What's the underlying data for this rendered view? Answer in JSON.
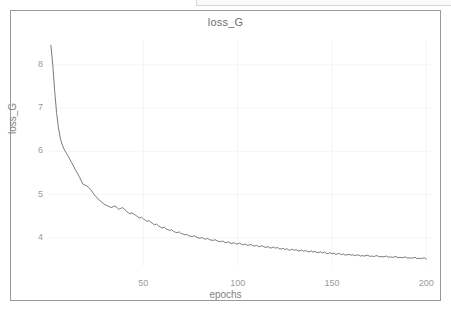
{
  "chart_data": {
    "type": "line",
    "title": "loss_G",
    "xlabel": "epochs",
    "ylabel": "loss_G",
    "xlim": [
      0,
      203
    ],
    "ylim": [
      3.35,
      8.55
    ],
    "grid": true,
    "legend": null,
    "xticks": [
      50,
      100,
      150,
      200
    ],
    "xtick_labels": [
      "50",
      "100",
      "150",
      "200"
    ],
    "yticks": [
      4,
      5,
      6,
      7,
      8
    ],
    "ytick_labels": [
      "4",
      "5",
      "6",
      "7",
      "8"
    ],
    "line_color": "#7a7a7a",
    "series": [
      {
        "name": "loss_G",
        "x": [
          1,
          2,
          3,
          4,
          5,
          6,
          7,
          8,
          9,
          10,
          11,
          12,
          13,
          14,
          15,
          16,
          17,
          18,
          19,
          20,
          21,
          22,
          23,
          24,
          25,
          26,
          27,
          28,
          29,
          30,
          31,
          32,
          33,
          34,
          35,
          36,
          37,
          38,
          39,
          40,
          41,
          42,
          43,
          44,
          45,
          46,
          47,
          48,
          49,
          50,
          51,
          52,
          53,
          54,
          55,
          56,
          57,
          58,
          59,
          60,
          61,
          62,
          63,
          64,
          65,
          66,
          67,
          68,
          69,
          70,
          71,
          72,
          73,
          74,
          75,
          76,
          77,
          78,
          79,
          80,
          81,
          82,
          83,
          84,
          85,
          86,
          87,
          88,
          89,
          90,
          91,
          92,
          93,
          94,
          95,
          96,
          97,
          98,
          99,
          100,
          101,
          102,
          103,
          104,
          105,
          106,
          107,
          108,
          109,
          110,
          111,
          112,
          113,
          114,
          115,
          116,
          117,
          118,
          119,
          120,
          121,
          122,
          123,
          124,
          125,
          126,
          127,
          128,
          129,
          130,
          131,
          132,
          133,
          134,
          135,
          136,
          137,
          138,
          139,
          140,
          141,
          142,
          143,
          144,
          145,
          146,
          147,
          148,
          149,
          150,
          151,
          152,
          153,
          154,
          155,
          156,
          157,
          158,
          159,
          160,
          161,
          162,
          163,
          164,
          165,
          166,
          167,
          168,
          169,
          170,
          171,
          172,
          173,
          174,
          175,
          176,
          177,
          178,
          179,
          180,
          181,
          182,
          183,
          184,
          185,
          186,
          187,
          188,
          189,
          190,
          191,
          192,
          193,
          194,
          195,
          196,
          197,
          198,
          199,
          200
        ],
        "y": [
          8.45,
          8.0,
          7.4,
          6.9,
          6.55,
          6.3,
          6.15,
          6.05,
          5.97,
          5.9,
          5.82,
          5.74,
          5.66,
          5.57,
          5.5,
          5.42,
          5.33,
          5.24,
          5.22,
          5.2,
          5.17,
          5.12,
          5.06,
          5.0,
          4.95,
          4.9,
          4.86,
          4.83,
          4.78,
          4.76,
          4.74,
          4.72,
          4.7,
          4.72,
          4.74,
          4.7,
          4.66,
          4.68,
          4.7,
          4.66,
          4.62,
          4.58,
          4.56,
          4.58,
          4.55,
          4.52,
          4.49,
          4.46,
          4.48,
          4.44,
          4.41,
          4.38,
          4.4,
          4.36,
          4.33,
          4.3,
          4.32,
          4.28,
          4.25,
          4.23,
          4.25,
          4.21,
          4.19,
          4.17,
          4.19,
          4.15,
          4.13,
          4.12,
          4.14,
          4.1,
          4.09,
          4.07,
          4.08,
          4.05,
          4.04,
          4.03,
          4.05,
          4.02,
          4.0,
          3.99,
          4.01,
          3.98,
          3.97,
          3.99,
          3.96,
          3.95,
          3.94,
          3.96,
          3.93,
          3.92,
          3.91,
          3.93,
          3.9,
          3.89,
          3.91,
          3.88,
          3.87,
          3.89,
          3.86,
          3.86,
          3.88,
          3.85,
          3.84,
          3.86,
          3.83,
          3.83,
          3.85,
          3.82,
          3.81,
          3.83,
          3.8,
          3.8,
          3.82,
          3.79,
          3.78,
          3.8,
          3.77,
          3.77,
          3.79,
          3.76,
          3.78,
          3.75,
          3.74,
          3.76,
          3.73,
          3.75,
          3.72,
          3.72,
          3.74,
          3.71,
          3.73,
          3.7,
          3.7,
          3.72,
          3.69,
          3.71,
          3.68,
          3.68,
          3.7,
          3.67,
          3.69,
          3.66,
          3.66,
          3.68,
          3.65,
          3.67,
          3.64,
          3.64,
          3.66,
          3.63,
          3.65,
          3.62,
          3.63,
          3.64,
          3.61,
          3.63,
          3.6,
          3.61,
          3.62,
          3.6,
          3.61,
          3.59,
          3.6,
          3.61,
          3.58,
          3.59,
          3.58,
          3.59,
          3.6,
          3.57,
          3.58,
          3.57,
          3.58,
          3.59,
          3.56,
          3.57,
          3.56,
          3.57,
          3.58,
          3.55,
          3.56,
          3.55,
          3.56,
          3.57,
          3.54,
          3.55,
          3.54,
          3.55,
          3.56,
          3.53,
          3.54,
          3.53,
          3.54,
          3.55,
          3.52,
          3.53,
          3.52,
          3.53,
          3.54,
          3.51
        ]
      }
    ]
  }
}
